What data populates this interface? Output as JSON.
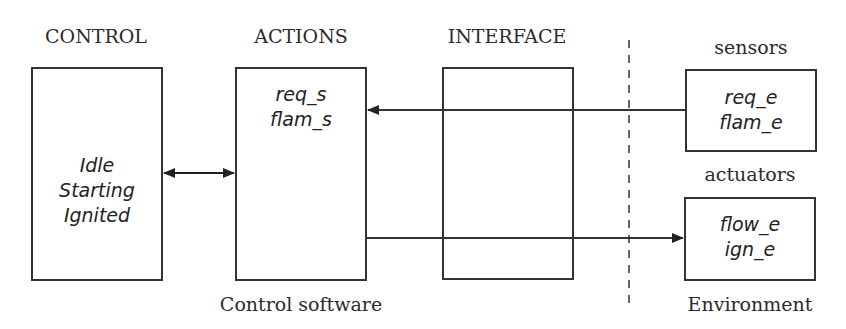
{
  "diagram": {
    "columns": {
      "control": {
        "heading": "CONTROL",
        "items": [
          "Idle",
          "Starting",
          "Ignited"
        ]
      },
      "actions": {
        "heading": "ACTIONS",
        "items": [
          "req_s",
          "flam_s"
        ]
      },
      "interface": {
        "heading": "INTERFACE",
        "items": []
      },
      "sensors": {
        "heading": "sensors",
        "items": [
          "req_e",
          "flam_e"
        ]
      },
      "actuators": {
        "heading": "actuators",
        "items": [
          "flow_e",
          "ign_e"
        ]
      }
    },
    "footers": {
      "control_software": "Control software",
      "environment": "Environment"
    },
    "connections": [
      {
        "from": "control",
        "to": "actions",
        "type": "bidirectional-arrow"
      },
      {
        "from": "sensors",
        "to": "actions",
        "type": "arrow"
      },
      {
        "from": "actions",
        "to": "actuators",
        "type": "arrow"
      }
    ],
    "boundary": "dashed-vertical-line"
  }
}
